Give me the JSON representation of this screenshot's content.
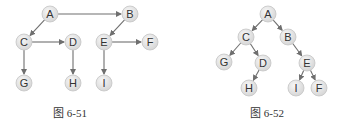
{
  "figures": [
    {
      "caption": "图 6-51",
      "caption_pos": [
        70,
        104
      ],
      "nodes": [
        {
          "id": "A",
          "x": 50,
          "y": 14
        },
        {
          "id": "B",
          "x": 130,
          "y": 14
        },
        {
          "id": "C",
          "x": 24,
          "y": 42
        },
        {
          "id": "D",
          "x": 73,
          "y": 42
        },
        {
          "id": "E",
          "x": 104,
          "y": 42
        },
        {
          "id": "F",
          "x": 150,
          "y": 42
        },
        {
          "id": "G",
          "x": 24,
          "y": 83
        },
        {
          "id": "H",
          "x": 73,
          "y": 83
        },
        {
          "id": "I",
          "x": 104,
          "y": 83
        }
      ],
      "edges": [
        [
          "A",
          "B"
        ],
        [
          "A",
          "C"
        ],
        [
          "C",
          "D"
        ],
        [
          "C",
          "G"
        ],
        [
          "D",
          "H"
        ],
        [
          "B",
          "E"
        ],
        [
          "E",
          "F"
        ],
        [
          "E",
          "I"
        ]
      ]
    },
    {
      "caption": "图 6-52",
      "caption_pos": [
        267,
        104
      ],
      "nodes": [
        {
          "id": "A",
          "x": 268,
          "y": 14
        },
        {
          "id": "C",
          "x": 246,
          "y": 37
        },
        {
          "id": "B",
          "x": 288,
          "y": 37
        },
        {
          "id": "G",
          "x": 224,
          "y": 62
        },
        {
          "id": "D",
          "x": 263,
          "y": 63
        },
        {
          "id": "H",
          "x": 249,
          "y": 88
        },
        {
          "id": "E",
          "x": 307,
          "y": 63
        },
        {
          "id": "I",
          "x": 296,
          "y": 88
        },
        {
          "id": "F",
          "x": 319,
          "y": 88
        }
      ],
      "edges": [
        [
          "A",
          "C"
        ],
        [
          "A",
          "B"
        ],
        [
          "C",
          "G"
        ],
        [
          "C",
          "D"
        ],
        [
          "D",
          "H"
        ],
        [
          "B",
          "E"
        ],
        [
          "E",
          "I"
        ],
        [
          "E",
          "F"
        ]
      ]
    }
  ],
  "style": {
    "node_fill": "#e3e3e3",
    "node_stroke": "#c4c4c4",
    "edge_color": "#6f6f6f",
    "label_color": "#333333",
    "node_radius": 8
  }
}
